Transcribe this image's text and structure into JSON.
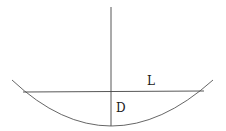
{
  "diagram": {
    "labels": {
      "L": "L",
      "D": "D"
    },
    "colors": {
      "line": "#3a3a3a",
      "text": "#1a1a1a",
      "background": "#ffffff"
    }
  }
}
